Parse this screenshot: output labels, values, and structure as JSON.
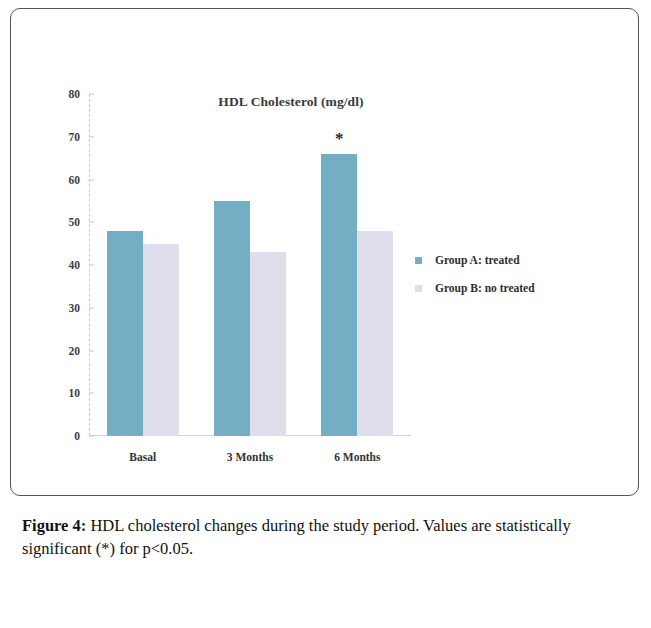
{
  "figure": {
    "caption_label": "Figure 4:",
    "caption_text": " HDL cholesterol changes during the study period. Values are statistically significant (*) for p<0.05."
  },
  "legend": {
    "position": "right",
    "items": [
      {
        "label": "Group A: treated",
        "color": "#74aec5"
      },
      {
        "label": "Group B: no treated",
        "color": "#e0ddec"
      }
    ]
  },
  "annotations": {
    "significance_marker": "*"
  },
  "chart_data": {
    "type": "bar",
    "title": "HDL Cholesterol (mg/dl)",
    "xlabel": "",
    "ylabel": "",
    "categories": [
      "Basal",
      "3 Months",
      "6 Months"
    ],
    "series": [
      {
        "name": "Group A: treated",
        "color": "#74aec5",
        "values": [
          48,
          55,
          66
        ]
      },
      {
        "name": "Group B: no treated",
        "color": "#e0ddec",
        "values": [
          45,
          43,
          48
        ]
      }
    ],
    "ylim": [
      0,
      80
    ],
    "yticks": [
      0,
      10,
      20,
      30,
      40,
      50,
      60,
      70,
      80
    ],
    "grid": false,
    "annotations": [
      {
        "text": "*",
        "category": "6 Months",
        "series": "Group A: treated",
        "note": "statistically significant p<0.05"
      }
    ]
  }
}
